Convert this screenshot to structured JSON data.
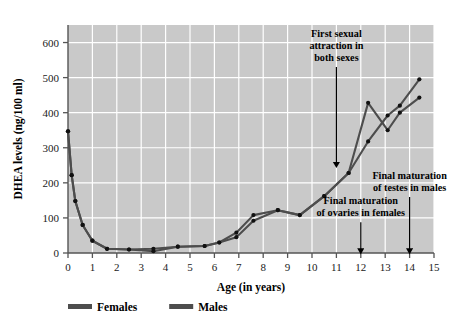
{
  "chart_data": {
    "type": "line",
    "title": "",
    "xlabel": "Age (in years)",
    "ylabel": "DHEA levels (ng/100 ml)",
    "xlim": [
      0,
      15
    ],
    "ylim": [
      0,
      650
    ],
    "xticks": [
      0,
      1,
      2,
      3,
      4,
      5,
      6,
      7,
      8,
      9,
      10,
      11,
      12,
      13,
      14,
      15
    ],
    "yticks": [
      0,
      100,
      200,
      300,
      400,
      500,
      600
    ],
    "xtick_labels": [
      "0",
      "1",
      "2",
      "3",
      "4",
      "5",
      "6",
      "7",
      "8",
      "9",
      "10",
      "11",
      "12",
      "13",
      "14",
      "15"
    ],
    "ytick_labels": [
      "0",
      "100",
      "200",
      "300",
      "400",
      "500",
      "600"
    ],
    "grid": true,
    "grid_color": "#ffffff",
    "plot_background": "#c9c9c9",
    "legend_position": "below-left",
    "series": [
      {
        "name": "Females",
        "color": "#4d4d4d",
        "points": [
          [
            0.0,
            347
          ],
          [
            0.15,
            222
          ],
          [
            0.3,
            148
          ],
          [
            0.6,
            80
          ],
          [
            1.0,
            35
          ],
          [
            1.6,
            12
          ],
          [
            2.5,
            10
          ],
          [
            3.5,
            5
          ],
          [
            4.5,
            18
          ],
          [
            5.6,
            20
          ],
          [
            6.2,
            30
          ],
          [
            6.9,
            58
          ],
          [
            7.6,
            108
          ],
          [
            8.6,
            122
          ],
          [
            9.5,
            108
          ],
          [
            10.5,
            162
          ],
          [
            11.5,
            228
          ],
          [
            12.3,
            428
          ],
          [
            13.1,
            350
          ],
          [
            13.6,
            400
          ],
          [
            14.4,
            443
          ]
        ]
      },
      {
        "name": "Males",
        "color": "#4d4d4d",
        "points": [
          [
            0.0,
            347
          ],
          [
            0.15,
            222
          ],
          [
            0.3,
            148
          ],
          [
            0.6,
            80
          ],
          [
            1.0,
            35
          ],
          [
            1.6,
            12
          ],
          [
            2.5,
            10
          ],
          [
            3.5,
            12
          ],
          [
            4.5,
            18
          ],
          [
            5.6,
            20
          ],
          [
            6.2,
            30
          ],
          [
            6.9,
            45
          ],
          [
            7.6,
            92
          ],
          [
            8.6,
            122
          ],
          [
            9.5,
            108
          ],
          [
            10.5,
            162
          ],
          [
            11.5,
            228
          ],
          [
            12.3,
            318
          ],
          [
            13.1,
            392
          ],
          [
            13.6,
            420
          ],
          [
            14.4,
            495
          ]
        ]
      }
    ],
    "annotations": [
      {
        "id": "first-sexual-attraction",
        "lines": [
          "First sexual",
          "attraction in",
          "both sexes"
        ],
        "arrow_x": 11.0,
        "arrow_from_y": 530,
        "arrow_to_y": 268
      },
      {
        "id": "final-maturation-ovaries",
        "lines": [
          "Final maturation",
          "of ovaries in females"
        ],
        "arrow_x": 12.0,
        "arrow_from_y": 88,
        "arrow_to_y": 22
      },
      {
        "id": "final-maturation-testes",
        "lines": [
          "Final maturation",
          "of testes in males"
        ],
        "arrow_x": 14.0,
        "arrow_from_y": 160,
        "arrow_to_y": 22
      }
    ]
  },
  "legend": {
    "items": [
      {
        "label": "Females",
        "color": "#4d4d4d"
      },
      {
        "label": "Males",
        "color": "#4d4d4d"
      }
    ]
  }
}
